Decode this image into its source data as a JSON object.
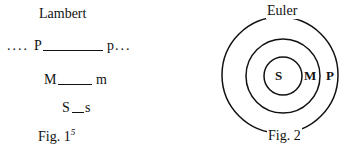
{
  "left_figure": {
    "title": "Lambert",
    "row1": {
      "left_dots": "....",
      "left": "P",
      "right": "p",
      "right_dots": "..."
    },
    "row2": {
      "left": "M",
      "right": "m"
    },
    "row3": {
      "left": "S",
      "right": "s"
    },
    "caption": "Fig. 1",
    "caption_sup": "5"
  },
  "right_figure": {
    "title": "Euler",
    "labels": {
      "inner": "S",
      "middle": "M",
      "outer": "P"
    },
    "caption": "Fig. 2"
  }
}
